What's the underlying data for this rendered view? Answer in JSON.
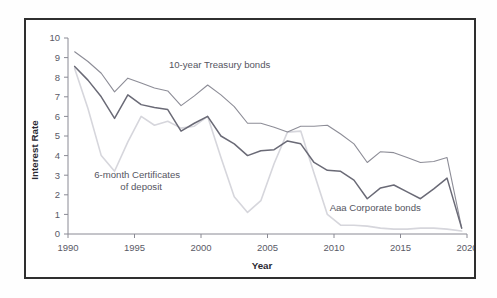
{
  "figure": {
    "border_color": "#2f2f2f",
    "background": "#ffffff"
  },
  "chart_data": {
    "type": "line",
    "title": "",
    "subtitle": "",
    "xlabel": "Year",
    "ylabel": "Interest Rate",
    "xlim": [
      1990,
      2020
    ],
    "ylim": [
      0,
      10
    ],
    "xticks": [
      1990,
      1995,
      2000,
      2005,
      2010,
      2015,
      2020
    ],
    "xtick_labels": [
      "1990",
      "1995",
      "2000",
      "2005",
      "2010",
      "2015",
      "2020"
    ],
    "yticks": [
      0,
      1,
      2,
      3,
      4,
      5,
      6,
      7,
      8,
      9,
      10
    ],
    "ytick_labels": [
      "0",
      "1",
      "2",
      "3",
      "4",
      "5",
      "6",
      "7",
      "8",
      "9",
      "10"
    ],
    "grid": false,
    "legend_position": "inline-annotations",
    "x": [
      1990.5,
      1991.5,
      1992.5,
      1993.5,
      1994.5,
      1995.5,
      1996.5,
      1997.5,
      1998.5,
      1999.5,
      2000.5,
      2001.5,
      2002.5,
      2003.5,
      2004.5,
      2005.5,
      2006.5,
      2007.5,
      2008.5,
      2009.5,
      2010.5,
      2011.5,
      2012.5,
      2013.5,
      2014.5,
      2015.5,
      2016.5,
      2017.5,
      2018.5,
      2019.6
    ],
    "series": [
      {
        "name": "Aaa Corporate bonds",
        "color": "#8d8d97",
        "width": 1.1,
        "label_text": "Aaa Corporate bonds",
        "label_x": 2013.1,
        "label_y": 1.15,
        "values": [
          9.3,
          8.8,
          8.2,
          7.25,
          7.95,
          7.7,
          7.45,
          7.3,
          6.55,
          7.05,
          7.6,
          7.1,
          6.5,
          5.65,
          5.65,
          5.45,
          5.2,
          5.5,
          5.5,
          5.55,
          5.1,
          4.6,
          3.65,
          4.2,
          4.15,
          3.9,
          3.65,
          3.7,
          3.9,
          0.3
        ]
      },
      {
        "name": "10-year Treasury bonds",
        "color": "#6a6a76",
        "width": 1.5,
        "label_text": "10-year Treasury bonds",
        "label_x": 2001.4,
        "label_y": 8.45,
        "values": [
          8.55,
          7.85,
          7.0,
          5.9,
          7.1,
          6.6,
          6.45,
          6.35,
          5.25,
          5.65,
          6.0,
          5.0,
          4.6,
          4.0,
          4.25,
          4.3,
          4.75,
          4.6,
          3.65,
          3.25,
          3.2,
          2.75,
          1.8,
          2.35,
          2.5,
          2.15,
          1.8,
          2.3,
          2.85,
          0.3
        ]
      },
      {
        "name": "6-month Certificates of deposit",
        "color": "#d6d6dc",
        "width": 1.6,
        "label_text_line1": "6-month Certificates",
        "label_text_line2": "of deposit",
        "label_x": 1995.2,
        "label_y": 2.85,
        "values": [
          8.45,
          6.4,
          4.0,
          3.2,
          4.7,
          6.0,
          5.55,
          5.75,
          5.4,
          5.5,
          6.0,
          3.9,
          1.9,
          1.1,
          1.7,
          3.6,
          5.2,
          5.25,
          3.1,
          1.0,
          0.45,
          0.45,
          0.4,
          0.3,
          0.25,
          0.25,
          0.3,
          0.3,
          0.25,
          0.15
        ]
      }
    ]
  }
}
